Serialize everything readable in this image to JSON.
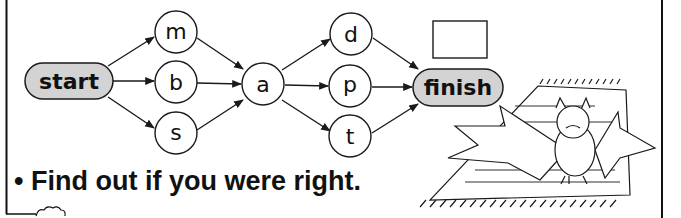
{
  "diagram": {
    "start_label": "start",
    "finish_label": "finish",
    "column1": [
      "m",
      "b",
      "s"
    ],
    "middle": "a",
    "column3": [
      "d",
      "p",
      "t"
    ],
    "answer_box": "",
    "pill_fill": "#d3d3d3",
    "stroke": "#1a1a1a"
  },
  "instruction": {
    "bullet": "•",
    "text": "Find out if you were right."
  },
  "illustration": {
    "subject": "bat on a rug"
  }
}
